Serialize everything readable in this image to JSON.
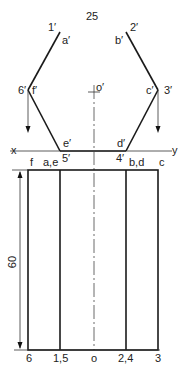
{
  "title_dimension": "25",
  "height_dimension": "60",
  "reference_line": {
    "x_label": "x",
    "y_label": "y"
  },
  "front_view_labels": {
    "p1": "1′",
    "a": "a′",
    "p2": "2′",
    "b": "b′",
    "p6": "6′",
    "f": "f′",
    "p3": "3′",
    "c": "c′",
    "o": "o′",
    "e": "e′",
    "p5": "5′",
    "d": "d′",
    "p4": "4′"
  },
  "top_view_labels": {
    "f": "f",
    "ae": "a,e",
    "bd": "b,d",
    "c": "c"
  },
  "bottom_labels": [
    "6",
    "1,5",
    "o",
    "2,4",
    "3"
  ]
}
